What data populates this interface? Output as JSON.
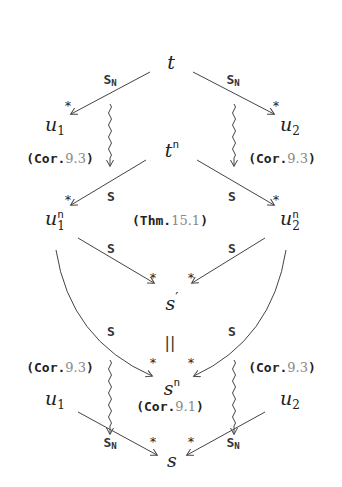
{
  "diagram": {
    "nodes": {
      "t": {
        "base": "t",
        "sup": "",
        "sub": ""
      },
      "u1_top": {
        "base": "u",
        "sub": "1",
        "sup": ""
      },
      "u2_top": {
        "base": "u",
        "sub": "2",
        "sup": ""
      },
      "tn": {
        "base": "t",
        "sup": "n",
        "sub": ""
      },
      "u1n": {
        "base": "u",
        "sub": "1",
        "sup": "n"
      },
      "u2n": {
        "base": "u",
        "sub": "2",
        "sup": "n"
      },
      "s_prime": {
        "base": "s",
        "sup": "′",
        "sub": ""
      },
      "sn": {
        "base": "s",
        "sup": "n",
        "sub": ""
      },
      "u1_bottom": {
        "base": "u",
        "sub": "1",
        "sup": ""
      },
      "u2_bottom": {
        "base": "u",
        "sub": "2",
        "sup": ""
      },
      "s": {
        "base": "s",
        "sup": "",
        "sub": ""
      }
    },
    "edge_labels": {
      "S_N": {
        "main": "S",
        "sub": "N"
      },
      "S": "S",
      "star": "*",
      "equals": "||"
    },
    "references": {
      "cor93": {
        "kind": "Cor.",
        "num": "9.3"
      },
      "thm151": {
        "kind": "Thm.",
        "num": "15.1"
      },
      "cor91": {
        "kind": "Cor.",
        "num": "9.1"
      }
    },
    "colors": {
      "line": "#444444",
      "text": "#222222",
      "ref_number": "#888888"
    }
  }
}
